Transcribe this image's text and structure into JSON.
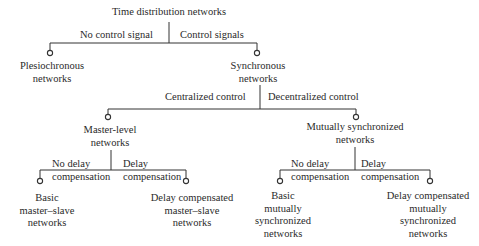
{
  "diagram": {
    "type": "tree",
    "root": {
      "label": "Time distribution networks",
      "branches": [
        {
          "edge_label": "No control signal",
          "node": {
            "lines": [
              "Plesiochronous",
              "networks"
            ]
          }
        },
        {
          "edge_label": "Control signals",
          "node": {
            "lines": [
              "Synchronous",
              "networks"
            ],
            "branches": [
              {
                "edge_label": "Centralized control",
                "node": {
                  "lines": [
                    "Master-level",
                    "networks"
                  ],
                  "branches": [
                    {
                      "edge_label": [
                        "No delay",
                        "compensation"
                      ],
                      "node": {
                        "lines": [
                          "Basic",
                          "master–slave",
                          "networks"
                        ]
                      }
                    },
                    {
                      "edge_label": [
                        "Delay",
                        "compensation"
                      ],
                      "node": {
                        "lines": [
                          "Delay compensated",
                          "master–slave",
                          "networks"
                        ]
                      }
                    }
                  ]
                }
              },
              {
                "edge_label": "Decentralized control",
                "node": {
                  "lines": [
                    "Mutually synchronized",
                    "networks"
                  ],
                  "branches": [
                    {
                      "edge_label": [
                        "No delay",
                        "compensation"
                      ],
                      "node": {
                        "lines": [
                          "Basic",
                          "mutually",
                          "synchronized",
                          "networks"
                        ]
                      }
                    },
                    {
                      "edge_label": [
                        "Delay",
                        "compensation"
                      ],
                      "node": {
                        "lines": [
                          "Delay compensated",
                          "mutually",
                          "synchronized",
                          "networks"
                        ]
                      }
                    }
                  ]
                }
              }
            ]
          }
        }
      ]
    }
  },
  "colors": {
    "line": "#333333",
    "text": "#2a2a2a",
    "background": "#ffffff"
  }
}
